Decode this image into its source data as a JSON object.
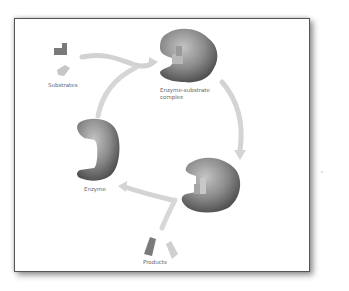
{
  "diagram": {
    "labels": {
      "substrates": "Substrates",
      "complex_line1": "Enzyme-substrate",
      "complex_line2": "complex",
      "enzyme": "Enzyme",
      "products": "Products"
    },
    "nodes": [
      {
        "id": "substrates",
        "label": "Substrates"
      },
      {
        "id": "enzyme-substrate-complex",
        "label": "Enzyme-substrate complex"
      },
      {
        "id": "enzyme-product-complex",
        "label": ""
      },
      {
        "id": "products",
        "label": "Products"
      },
      {
        "id": "enzyme",
        "label": "Enzyme"
      }
    ],
    "edges": [
      {
        "from": "substrates",
        "to": "enzyme-substrate-complex"
      },
      {
        "from": "enzyme",
        "to": "enzyme-substrate-complex"
      },
      {
        "from": "enzyme-substrate-complex",
        "to": "enzyme-product-complex"
      },
      {
        "from": "enzyme-product-complex",
        "to": "enzyme"
      },
      {
        "from": "enzyme-product-complex",
        "to": "products"
      }
    ],
    "colors": {
      "enzyme_dark": "#5a5a5a",
      "enzyme_light": "#b5b5b5",
      "arrow": "#d0d0d0",
      "substrate_dark": "#7a7a7a",
      "substrate_light": "#c8c8c8",
      "frame_border": "#555555"
    }
  }
}
